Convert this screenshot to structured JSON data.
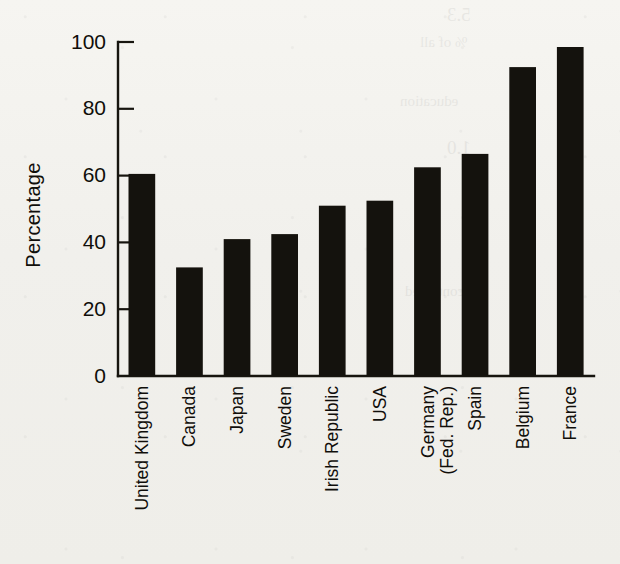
{
  "figure": {
    "background_color": "#f2f1ed",
    "ink_color": "#14120d",
    "ghost_text": [
      "5.3",
      "% of all",
      "education",
      "1.0",
      "continued"
    ]
  },
  "chart_data": {
    "type": "bar",
    "title": "",
    "xlabel": "",
    "ylabel": "Percentage",
    "ylim": [
      0,
      100
    ],
    "yticks": [
      0,
      20,
      40,
      60,
      80,
      100
    ],
    "ytick_labels": [
      "0",
      "20",
      "40",
      "60",
      "80",
      "100"
    ],
    "grid": false,
    "legend": false,
    "bar_color": "#14120d",
    "categories": [
      "United Kingdom",
      "Canada",
      "Japan",
      "Sweden",
      "Irish Republic",
      "USA",
      "Germany (Fed. Rep.)",
      "Spain",
      "Belgium",
      "France"
    ],
    "category_lines": [
      [
        "United Kingdom"
      ],
      [
        "Canada"
      ],
      [
        "Japan"
      ],
      [
        "Sweden"
      ],
      [
        "Irish Republic"
      ],
      [
        "USA"
      ],
      [
        "Germany",
        "(Fed. Rep.)"
      ],
      [
        "Spain"
      ],
      [
        "Belgium"
      ],
      [
        "France"
      ]
    ],
    "values": [
      60.5,
      32.5,
      41,
      42.5,
      51,
      52.5,
      62.5,
      66.5,
      92.5,
      98.5
    ]
  }
}
